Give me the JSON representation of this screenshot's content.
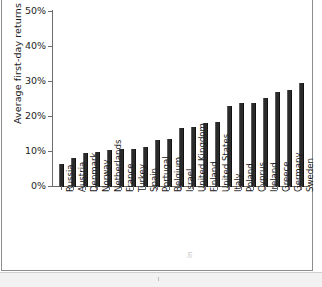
{
  "chart_data": {
    "type": "bar",
    "title": "",
    "xlabel": "",
    "ylabel": "Average first-day returns",
    "ylim": [
      0,
      50
    ],
    "yunit": "%",
    "ytick_labels": [
      "0%",
      "10%",
      "20%",
      "30%",
      "40%",
      "50%"
    ],
    "ytick_values": [
      0,
      10,
      20,
      30,
      40,
      50
    ],
    "grid": false,
    "legend": "none",
    "bar_color": "#2b2b2b",
    "axis_color": "#6b6b6b",
    "categories": [
      "Russia",
      "Austria",
      "Denmark",
      "Norway",
      "Netherlands",
      "France",
      "Turkey",
      "Spain",
      "Portugal",
      "Belgium",
      "Israel",
      "United Kingdom",
      "Finland",
      "United States",
      "Italy",
      "Poland",
      "Cyprus",
      "Ireland",
      "Greece",
      "Germany",
      "Sweden"
    ],
    "values": [
      6.5,
      8.2,
      9.6,
      10.1,
      10.5,
      10.7,
      10.7,
      11.4,
      13.4,
      13.8,
      16.9,
      17.1,
      18.2,
      18.4,
      23.2,
      23.9,
      23.9,
      25.3,
      27.2,
      27.5,
      29.5
    ]
  },
  "figure": {
    "faint_margin_note": "in"
  }
}
